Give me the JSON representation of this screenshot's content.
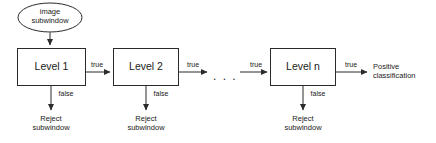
{
  "diagram": {
    "type": "flowchart",
    "stroke_color": "#2b2b2b",
    "text_color": "#1a1a1a",
    "background_color": "#ffffff",
    "input": {
      "shape": "ellipse",
      "line1": "image",
      "line2": "subwindow"
    },
    "stages": [
      {
        "label": "Level 1",
        "true_label": "true",
        "false_label": "false",
        "reject_line1": "Reject",
        "reject_line2": "subwindow"
      },
      {
        "label": "Level 2",
        "true_label": "true",
        "false_label": "false",
        "reject_line1": "Reject",
        "reject_line2": "subwindow"
      },
      {
        "label": "Level n",
        "true_label": "true",
        "false_label": "false",
        "reject_line1": "Reject",
        "reject_line2": "subwindow"
      }
    ],
    "ellipsis": ". . .",
    "ellipsis_true_label": "true",
    "output": {
      "line1": "Positive",
      "line2": "classification"
    }
  }
}
